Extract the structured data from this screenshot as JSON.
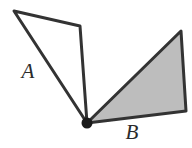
{
  "figure": {
    "background_color": "#ffffff",
    "stroke_color": "#333333",
    "stroke_width": 3,
    "vertex_dot": {
      "name": "common-vertex",
      "x": 87,
      "y": 123,
      "radius": 5,
      "color": "#1a1a1a"
    },
    "shapes": [
      {
        "id": "triangle-a",
        "label": "A",
        "fill": "none",
        "fill_label": "unshaded",
        "points": "14,11 80,26 87,123"
      },
      {
        "id": "triangle-b",
        "label": "B",
        "fill": "#bdbdbd",
        "fill_label": "shaded",
        "points": "87,123 181,31 186,111"
      }
    ],
    "labels": [
      {
        "id": "label-a",
        "text": "A",
        "x": 28,
        "y": 78
      },
      {
        "id": "label-b",
        "text": "B",
        "x": 132,
        "y": 139
      }
    ]
  }
}
